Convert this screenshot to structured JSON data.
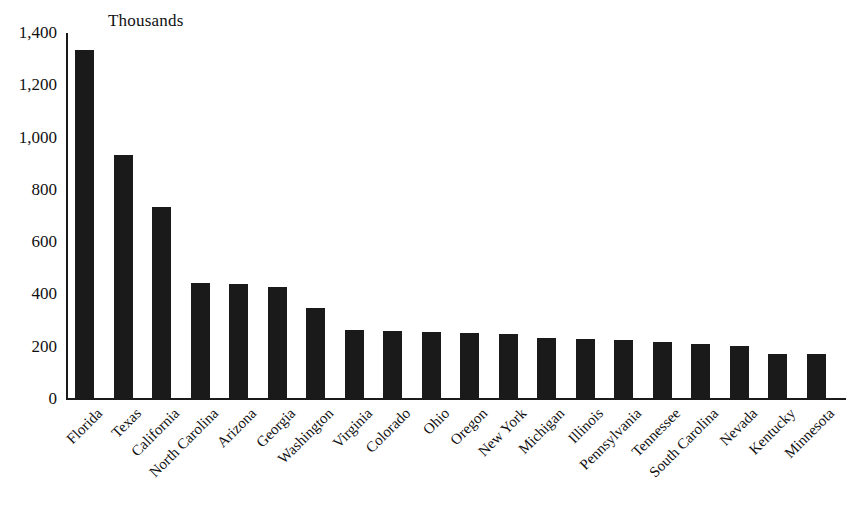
{
  "chart_data": {
    "type": "bar",
    "title": "Thousands",
    "xlabel": "",
    "ylabel": "",
    "ylim": [
      0,
      1400
    ],
    "yticks": [
      "0",
      "200",
      "400",
      "600",
      "800",
      "1,000",
      "1,200",
      "1,400"
    ],
    "ytick_values": [
      0,
      200,
      400,
      600,
      800,
      1000,
      1200,
      1400
    ],
    "grid": false,
    "legend": "none",
    "bar_color": "#1a1a1a",
    "axis_color": "#1a1a1a",
    "background_color": "#ffffff",
    "categories": [
      "Florida",
      "Texas",
      "California",
      "North Carolina",
      "Arizona",
      "Georgia",
      "Washington",
      "Virginia",
      "Colorado",
      "Ohio",
      "Oregon",
      "New York",
      "Michigan",
      "Illinois",
      "Pennsylvania",
      "Tennessee",
      "South Carolina",
      "Nevada",
      "Kentucky",
      "Minnesota"
    ],
    "values": [
      1330,
      930,
      730,
      440,
      435,
      425,
      345,
      260,
      255,
      252,
      250,
      243,
      230,
      225,
      222,
      215,
      205,
      200,
      170,
      168
    ]
  }
}
